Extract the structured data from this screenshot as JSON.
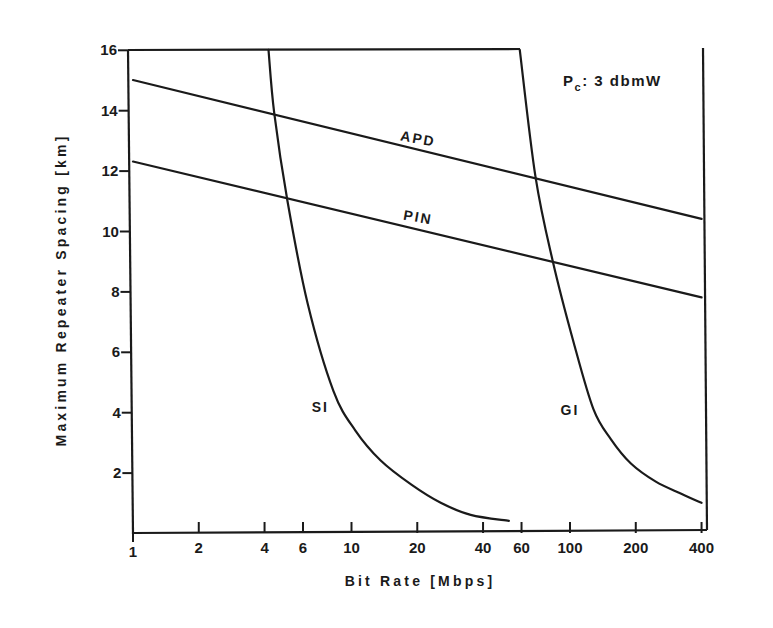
{
  "chart_data": {
    "type": "line",
    "title": "",
    "xlabel": "Bit Rate [Mbps]",
    "ylabel": "Maximum Repeater Spacing [km]",
    "xscale": "log",
    "xlim": [
      1,
      400
    ],
    "ylim": [
      0,
      16
    ],
    "grid": false,
    "legend": "none (curves labeled inline)",
    "x_ticks": [
      1,
      2,
      4,
      6,
      10,
      20,
      40,
      60,
      100,
      200,
      400
    ],
    "x_tick_labels": [
      "1",
      "2",
      "4",
      "6",
      "10",
      "20",
      "40",
      "60",
      "100",
      "200",
      "400"
    ],
    "y_ticks": [
      2,
      4,
      6,
      8,
      10,
      12,
      14,
      16
    ],
    "y_tick_labels": [
      "2",
      "4",
      "6",
      "8",
      "10",
      "12",
      "14",
      "16"
    ],
    "annotations": [
      {
        "text": "Pc: 3 dbmW",
        "main": "P",
        "sub": "c",
        "rest": ": 3 dbmW",
        "x": 160,
        "y": 15.3
      }
    ],
    "series": [
      {
        "name": "APD",
        "label": "APD",
        "x": [
          1,
          400
        ],
        "y": [
          15.0,
          10.4
        ],
        "label_at": [
          20,
          12.9
        ],
        "label_angle": 10
      },
      {
        "name": "PIN",
        "label": "PIN",
        "x": [
          1,
          400
        ],
        "y": [
          12.3,
          7.8
        ],
        "label_at": [
          20,
          10.3
        ],
        "label_angle": 10
      },
      {
        "name": "SI",
        "label": "SI",
        "x": [
          4.17,
          4.43,
          5.09,
          6.3,
          8.27,
          10.4,
          13.6,
          18.8,
          25.6,
          35.1,
          52.5
        ],
        "y": [
          16.0,
          13.9,
          11.0,
          7.6,
          4.7,
          3.4,
          2.4,
          1.6,
          1.0,
          0.6,
          0.4
        ],
        "label_at": [
          7.2,
          4.0
        ]
      },
      {
        "name": "GI",
        "label": "GI",
        "x": [
          58.9,
          69.5,
          83.4,
          104,
          128,
          154,
          190,
          247,
          323,
          400
        ],
        "y": [
          16.0,
          11.8,
          9.0,
          6.3,
          4.1,
          3.1,
          2.3,
          1.7,
          1.3,
          1.0
        ],
        "label_at": [
          100,
          3.9
        ]
      }
    ]
  }
}
